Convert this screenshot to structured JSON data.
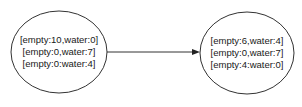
{
  "diagram": {
    "type": "state-transition",
    "nodes": [
      {
        "id": "state-1",
        "lines": [
          "[empty:10,water:0]",
          "[empty:0,water:7]",
          "[empty:0:water:4]"
        ]
      },
      {
        "id": "state-2",
        "lines": [
          "[empty:6,water:4]",
          "[empty:0,water:7]",
          "[empty:4:water:0]"
        ]
      }
    ],
    "edges": [
      {
        "from": "state-1",
        "to": "state-2",
        "label": ""
      }
    ],
    "colors": {
      "stroke": "#333333",
      "text": "#1a1a1a",
      "background": "#ffffff"
    }
  }
}
